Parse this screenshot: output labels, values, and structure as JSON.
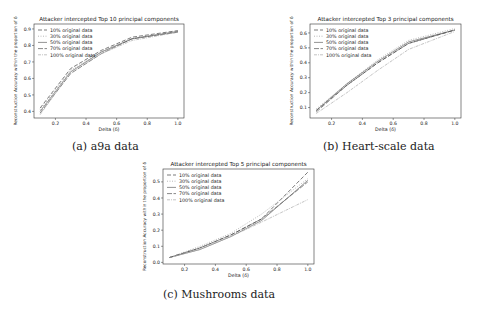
{
  "figure": {
    "background": "#ffffff",
    "line_color": "#555555"
  },
  "panels": [
    {
      "caption": "(a) a9a data",
      "title": "Attacker intercepted Top 10 principal components",
      "xlabel": "Delta (δ)",
      "ylabel": "Reconstruction Accuracy within the proportion of δ"
    },
    {
      "caption": "(b) Heart-scale data",
      "title": "Attacker intercepted Top 3 principal components",
      "xlabel": "Delta (δ)",
      "ylabel": "Reconstruction Accuracy within the proportion of δ"
    },
    {
      "caption": "(c) Mushrooms data",
      "title": "Attacker intercepted Top 5 principal components",
      "xlabel": "Delta (δ)",
      "ylabel": "Reconstruction Accuracy within the proportion of δ"
    }
  ],
  "chart_data": [
    {
      "type": "line",
      "title": "Attacker intercepted Top 10 principal components",
      "xlabel": "Delta (δ)",
      "ylabel": "Reconstruction Accuracy within the proportion of δ",
      "x": [
        0.1,
        0.3,
        0.5,
        0.7,
        1.0
      ],
      "xticks": [
        0.2,
        0.4,
        0.6,
        0.8,
        1.0
      ],
      "yticks": [
        0.4,
        0.5,
        0.6,
        0.7,
        0.8,
        0.9
      ],
      "xlim": [
        0.06,
        1.04
      ],
      "ylim": [
        0.36,
        0.93
      ],
      "grid": false,
      "legend_position": "upper left",
      "series": [
        {
          "name": "10% original data",
          "values": [
            0.42,
            0.66,
            0.77,
            0.85,
            0.89
          ],
          "dash": "4,2"
        },
        {
          "name": "30% original data",
          "values": [
            0.41,
            0.65,
            0.76,
            0.84,
            0.885
          ],
          "dash": "1,1.5"
        },
        {
          "name": "50% original data",
          "values": [
            0.4,
            0.64,
            0.76,
            0.84,
            0.885
          ],
          "dash": ""
        },
        {
          "name": "70% original data",
          "values": [
            0.39,
            0.63,
            0.75,
            0.84,
            0.88
          ],
          "dash": "5,1.5"
        },
        {
          "name": "100% original data",
          "values": [
            0.38,
            0.64,
            0.75,
            0.83,
            0.88
          ],
          "dash": "3,1,1,1"
        }
      ]
    },
    {
      "type": "line",
      "title": "Attacker intercepted Top 3 principal components",
      "xlabel": "Delta (δ)",
      "ylabel": "Reconstruction Accuracy within the proportion of δ",
      "x": [
        0.1,
        0.3,
        0.5,
        0.7,
        1.0
      ],
      "xticks": [
        0.2,
        0.4,
        0.6,
        0.8,
        1.0
      ],
      "yticks": [
        0.1,
        0.2,
        0.3,
        0.4,
        0.5,
        0.6
      ],
      "xlim": [
        0.06,
        1.04
      ],
      "ylim": [
        0.03,
        0.66
      ],
      "grid": false,
      "legend_position": "upper left",
      "series": [
        {
          "name": "10% original data",
          "values": [
            0.08,
            0.25,
            0.4,
            0.53,
            0.62
          ],
          "dash": "4,2"
        },
        {
          "name": "30% original data",
          "values": [
            0.09,
            0.26,
            0.42,
            0.55,
            0.63
          ],
          "dash": "1,1.5"
        },
        {
          "name": "50% original data",
          "values": [
            0.08,
            0.26,
            0.41,
            0.54,
            0.62
          ],
          "dash": ""
        },
        {
          "name": "70% original data",
          "values": [
            0.07,
            0.25,
            0.4,
            0.53,
            0.62
          ],
          "dash": "5,1.5"
        },
        {
          "name": "100% original data",
          "values": [
            0.06,
            0.2,
            0.35,
            0.49,
            0.61
          ],
          "dash": "3,1,1,1"
        }
      ]
    },
    {
      "type": "line",
      "title": "Attacker intercepted Top 5 principal components",
      "xlabel": "Delta (δ)",
      "ylabel": "Reconstruction Accuracy within the proportion of δ",
      "x": [
        0.1,
        0.3,
        0.5,
        0.7,
        1.0
      ],
      "xticks": [
        0.2,
        0.4,
        0.6,
        0.8,
        1.0
      ],
      "yticks": [
        0.0,
        0.1,
        0.2,
        0.3,
        0.4,
        0.5
      ],
      "xlim": [
        0.06,
        1.04
      ],
      "ylim": [
        -0.01,
        0.58
      ],
      "grid": false,
      "legend_position": "upper left",
      "series": [
        {
          "name": "10% original data",
          "values": [
            0.03,
            0.09,
            0.17,
            0.27,
            0.56
          ],
          "dash": "4,2"
        },
        {
          "name": "30% original data",
          "values": [
            0.03,
            0.1,
            0.18,
            0.3,
            0.52
          ],
          "dash": "1,1.5"
        },
        {
          "name": "50% original data",
          "values": [
            0.03,
            0.08,
            0.16,
            0.26,
            0.51
          ],
          "dash": ""
        },
        {
          "name": "70% original data",
          "values": [
            0.03,
            0.09,
            0.17,
            0.27,
            0.5
          ],
          "dash": "5,1.5"
        },
        {
          "name": "100% original data",
          "values": [
            0.03,
            0.08,
            0.16,
            0.25,
            0.39
          ],
          "dash": "3,1,1,1"
        }
      ]
    }
  ]
}
